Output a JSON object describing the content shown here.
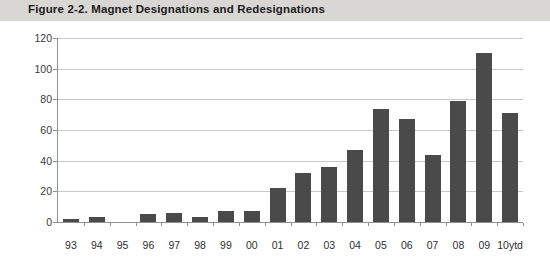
{
  "figure": {
    "title": "Figure 2-2. Magnet Designations and Redesignations",
    "band_color": "#d8d7d3"
  },
  "chart_data": {
    "type": "bar",
    "title": "Figure 2-2. Magnet Designations and Redesignations",
    "xlabel": "",
    "ylabel": "",
    "categories": [
      "93",
      "94",
      "95",
      "96",
      "97",
      "98",
      "99",
      "00",
      "01",
      "02",
      "03",
      "04",
      "05",
      "06",
      "07",
      "08",
      "09",
      "10ytd"
    ],
    "values": [
      2,
      3,
      0,
      5,
      6,
      3,
      7,
      7,
      22,
      32,
      36,
      47,
      74,
      67,
      44,
      79,
      110,
      71
    ],
    "ylim": [
      0,
      120
    ],
    "ytick_labels": [
      "120",
      "100",
      "80",
      "60",
      "40",
      "20",
      "0"
    ],
    "yticks": [
      120,
      100,
      80,
      60,
      40,
      20,
      0
    ],
    "grid": true,
    "legend": "none",
    "bar_color": "#4a4a4a",
    "gridline_color": "#c9c9c9",
    "axis_color": "#8f8f8f"
  }
}
